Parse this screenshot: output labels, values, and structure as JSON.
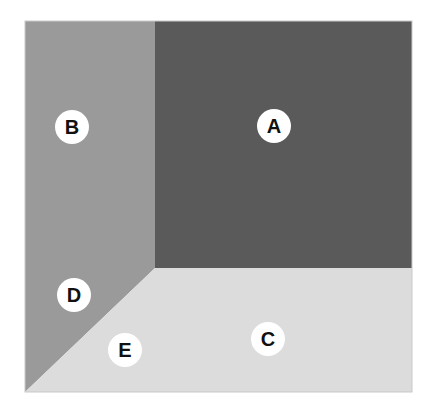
{
  "figure": {
    "background_color": "#ffffff",
    "bounds": {
      "x": 25,
      "y": 21,
      "width": 387,
      "height": 371
    },
    "tones": {
      "dark": "#5a5a5a",
      "medium": "#9a9a9a",
      "light": "#dcdcdc"
    },
    "label_circle": {
      "fill": "#ffffff",
      "text_color": "#111111",
      "radius": 17
    },
    "regions": [
      {
        "id": "A",
        "label": "A",
        "tone": "dark",
        "color": "#5a5a5a",
        "shape": "rectangle",
        "points": "155,21 412,21 412,268 155,268",
        "label_x": 274,
        "label_y": 126
      },
      {
        "id": "B",
        "label": "B",
        "tone": "medium",
        "color": "#9a9a9a",
        "shape": "rectangle",
        "points": "25,21 155,21 155,268 25,268",
        "label_x": 72,
        "label_y": 127
      },
      {
        "id": "C",
        "label": "C",
        "tone": "light",
        "color": "#dcdcdc",
        "shape": "polygon",
        "points": "155,268 412,268 412,392 25,392",
        "label_x": 268,
        "label_y": 339
      },
      {
        "id": "D",
        "label": "D",
        "tone": "medium",
        "color": "#9a9a9a",
        "shape": "triangle",
        "points": "25,268 155,268 25,392",
        "label_x": 74,
        "label_y": 295
      },
      {
        "id": "E",
        "label": "E",
        "tone": "light",
        "color": "#dcdcdc",
        "shape": "polygon-part",
        "points": "25,392 155,268 412,392",
        "label_x": 125,
        "label_y": 350
      }
    ],
    "edges": [
      {
        "name": "vertical-divider",
        "from": "155,21",
        "to": "155,268"
      },
      {
        "name": "horizontal-divider",
        "from": "155,268",
        "to": "412,268"
      },
      {
        "name": "diagonal-divider",
        "from": "155,268",
        "to": "25,392"
      }
    ]
  }
}
